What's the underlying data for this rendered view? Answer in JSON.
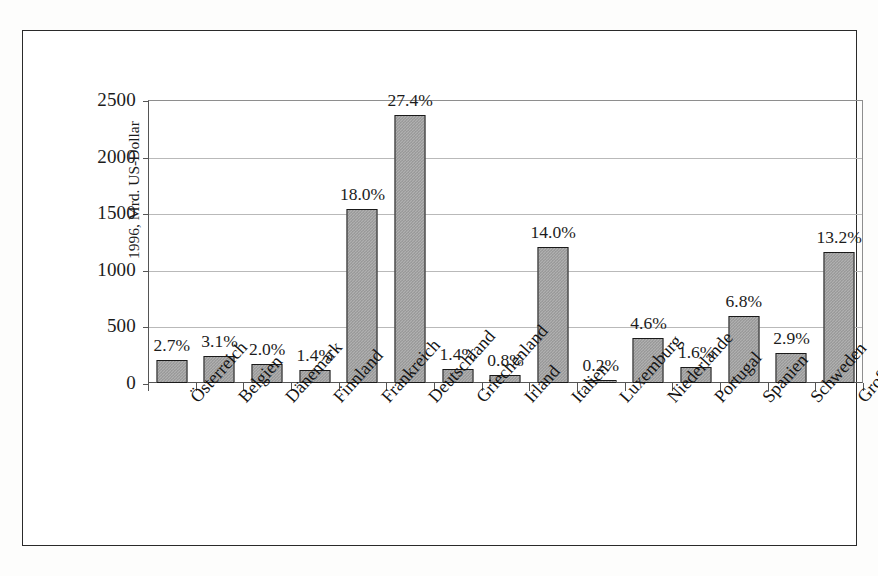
{
  "chart_data": {
    "type": "bar",
    "title": "",
    "xlabel": "",
    "ylabel": "1996, Mrd. US-Dollar",
    "ylim": [
      0,
      2500
    ],
    "ytick_values": [
      0,
      500,
      1000,
      1500,
      2000,
      2500
    ],
    "ytick_labels": [
      "0",
      "500",
      "1000",
      "1500",
      "2000",
      "2500"
    ],
    "grid": true,
    "legend": false,
    "categories": [
      "Österreich",
      "Belgien",
      "Dänemark",
      "Finnland",
      "Frankreich",
      "Deutschland",
      "Griechenland",
      "Irland",
      "Italien",
      "Luxemburg",
      "Niederlande",
      "Portugal",
      "Spanien",
      "Schweden",
      "Großbritannien"
    ],
    "values": [
      200,
      240,
      165,
      115,
      1540,
      2370,
      120,
      70,
      1205,
      15,
      400,
      140,
      595,
      265,
      1160
    ],
    "data_labels": [
      "2.7%",
      "3.1%",
      "2.0%",
      "1.4%",
      "18.0%",
      "27.4%",
      "1.4%",
      "0.8%",
      "14.0%",
      "0.2%",
      "4.6%",
      "1.6%",
      "6.8%",
      "2.9%",
      "13.2%"
    ],
    "colors": {
      "bar_fill": "#b0b0b0",
      "bar_pattern": "#8f8f8f",
      "bar_border": "#1a1a1a",
      "gridline": "#b9b9b9",
      "axis": "#555555",
      "text": "#1c1c1c",
      "frame": "#2a2a2a",
      "background": "#ffffff"
    }
  }
}
